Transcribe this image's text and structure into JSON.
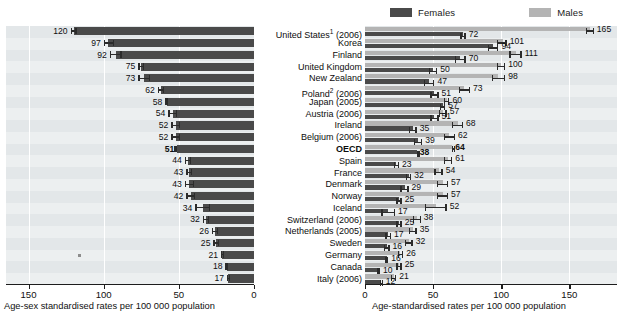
{
  "legend": {
    "females_label": "Females",
    "males_label": "Males",
    "females_color": "#4a4a4a",
    "males_color": "#b4b4b4"
  },
  "left_axis": {
    "title": "Age-sex standardised rates per 100 000 population",
    "ticks": [
      "150",
      "100",
      "50",
      "0"
    ],
    "max": 165,
    "reversed": true
  },
  "right_axis": {
    "title": "Age-standardised rates per 100 000 population",
    "ticks": [
      "0",
      "50",
      "100",
      "150"
    ],
    "max": 185,
    "reversed": false
  },
  "countries": [
    {
      "name": "United States",
      "note": "1",
      "year": "(2006)",
      "bold": false
    },
    {
      "name": "Korea",
      "note": "",
      "year": "",
      "bold": false
    },
    {
      "name": "Finland",
      "note": "",
      "year": "",
      "bold": false
    },
    {
      "name": "United Kingdom",
      "note": "",
      "year": "",
      "bold": false
    },
    {
      "name": "New Zealand",
      "note": "",
      "year": "",
      "bold": false
    },
    {
      "name": "Poland",
      "note": "2",
      "year": "(2006)",
      "bold": false
    },
    {
      "name": "Japan",
      "note": "",
      "year": "(2005)",
      "bold": false
    },
    {
      "name": "Austria",
      "note": "",
      "year": "(2006)",
      "bold": false
    },
    {
      "name": "Ireland",
      "note": "",
      "year": "",
      "bold": false
    },
    {
      "name": "Belgium",
      "note": "",
      "year": "(2006)",
      "bold": false
    },
    {
      "name": "OECD",
      "note": "",
      "year": "",
      "bold": true
    },
    {
      "name": "Spain",
      "note": "",
      "year": "",
      "bold": false
    },
    {
      "name": "France",
      "note": "",
      "year": "",
      "bold": false
    },
    {
      "name": "Denmark",
      "note": "",
      "year": "",
      "bold": false
    },
    {
      "name": "Norway",
      "note": "",
      "year": "",
      "bold": false
    },
    {
      "name": "Iceland",
      "note": "",
      "year": "",
      "bold": false
    },
    {
      "name": "Switzerland",
      "note": "",
      "year": "(2006)",
      "bold": false
    },
    {
      "name": "Netherlands",
      "note": "",
      "year": "(2005)",
      "bold": false
    },
    {
      "name": "Sweden",
      "note": "",
      "year": "",
      "bold": false
    },
    {
      "name": "Germany",
      "note": "",
      "year": "",
      "bold": false
    },
    {
      "name": "Canada",
      "note": "",
      "year": "",
      "bold": false
    },
    {
      "name": "Italy",
      "note": "",
      "year": "(2006)",
      "bold": false
    }
  ],
  "chart_data": [
    {
      "type": "bar",
      "id": "left-total",
      "title": "",
      "xlabel": "Age-sex standardised rates per 100 000 population",
      "ylabel": "",
      "orientation": "horizontal-right-to-left",
      "xlim": [
        0,
        165
      ],
      "grid": true,
      "xticks": [
        150,
        100,
        50,
        0
      ],
      "series": [
        {
          "name": "Total (age-sex standardised)",
          "color": "#4a4a4a",
          "values": [
            120,
            97,
            92,
            75,
            73,
            62,
            58,
            54,
            52,
            52,
            51,
            44,
            43,
            43,
            42,
            34,
            32,
            26,
            25,
            21,
            18,
            17
          ],
          "labels": [
            "120",
            "97",
            "92",
            "75",
            "73",
            "62",
            "58",
            "54",
            "52",
            "52",
            "51",
            "44",
            "43",
            "43",
            "42",
            "34",
            "32",
            "26",
            "25",
            "21",
            "18",
            "17"
          ],
          "bold_label_index": 10,
          "ci_low": [
            118,
            93,
            88,
            73,
            69,
            60,
            57,
            51,
            49,
            49,
            51,
            42,
            41,
            40,
            39,
            29,
            30,
            24,
            23,
            20,
            17,
            16
          ],
          "ci_high": [
            122,
            100,
            96,
            77,
            77,
            64,
            59,
            57,
            55,
            55,
            51,
            46,
            45,
            46,
            45,
            39,
            34,
            28,
            27,
            22,
            19,
            18
          ]
        }
      ],
      "extra_marker": {
        "row_index": 19,
        "value": 115,
        "note": "small marker on Germany row"
      }
    },
    {
      "type": "bar",
      "id": "right-by-sex",
      "title": "",
      "xlabel": "Age-standardised rates per 100 000 population",
      "ylabel": "",
      "orientation": "horizontal-left-to-right",
      "xlim": [
        0,
        185
      ],
      "grid": true,
      "xticks": [
        0,
        50,
        100,
        150
      ],
      "legend_position": "top",
      "categories": [
        "United States",
        "Korea",
        "Finland",
        "United Kingdom",
        "New Zealand",
        "Poland",
        "Japan",
        "Austria",
        "Ireland",
        "Belgium",
        "OECD",
        "Spain",
        "France",
        "Denmark",
        "Norway",
        "Iceland",
        "Switzerland",
        "Netherlands",
        "Sweden",
        "Germany",
        "Canada",
        "Italy"
      ],
      "series": [
        {
          "name": "Males",
          "color": "#b4b4b4",
          "values": [
            165,
            101,
            111,
            100,
            98,
            73,
            60,
            57,
            68,
            62,
            64,
            61,
            54,
            57,
            57,
            52,
            38,
            35,
            32,
            26,
            25,
            21
          ],
          "labels": [
            "165",
            "101",
            "111",
            "100",
            "98",
            "73",
            "60",
            "57",
            "68",
            "62",
            "64",
            "61",
            "54",
            "57",
            "57",
            "52",
            "38",
            "35",
            "32",
            "26",
            "25",
            "21"
          ],
          "bold_label_index": 10,
          "ci_low": [
            162,
            97,
            106,
            97,
            93,
            69,
            58,
            54,
            64,
            58,
            64,
            58,
            51,
            53,
            53,
            44,
            35,
            32,
            29,
            24,
            23,
            19
          ],
          "ci_high": [
            168,
            104,
            115,
            103,
            103,
            77,
            62,
            60,
            72,
            66,
            64,
            64,
            57,
            61,
            61,
            60,
            41,
            38,
            35,
            28,
            27,
            23
          ]
        },
        {
          "name": "Females",
          "color": "#4a4a4a",
          "values": [
            72,
            94,
            70,
            50,
            47,
            51,
            57,
            51,
            35,
            39,
            38,
            23,
            32,
            29,
            25,
            17,
            25,
            17,
            16,
            16,
            10,
            12
          ],
          "labels": [
            "72",
            "94",
            "70",
            "50",
            "47",
            "51",
            "57",
            "51",
            "35",
            "39",
            "38",
            "23",
            "32",
            "29",
            "25",
            "17",
            "25",
            "17",
            "16",
            "16",
            "10",
            "12"
          ],
          "bold_label_index": 10,
          "ci_low": [
            70,
            90,
            66,
            47,
            43,
            48,
            55,
            48,
            32,
            36,
            38,
            21,
            30,
            26,
            23,
            12,
            23,
            15,
            14,
            15,
            9,
            11
          ],
          "ci_high": [
            74,
            98,
            74,
            53,
            51,
            54,
            59,
            54,
            38,
            42,
            38,
            25,
            34,
            32,
            27,
            22,
            27,
            19,
            18,
            17,
            11,
            13
          ]
        }
      ]
    }
  ]
}
